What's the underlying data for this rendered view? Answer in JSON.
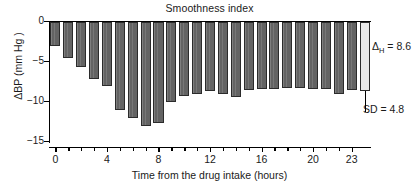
{
  "chart_data": {
    "type": "bar",
    "title": "Smoothness index",
    "xlabel": "Time from the drug intake (hours)",
    "ylabel": "ΔBP (mm Hg )",
    "ylabel_parts": {
      "delta": "Δ",
      "rest": "BP (mm Hg )"
    },
    "categories": [
      0,
      1,
      2,
      3,
      4,
      5,
      6,
      7,
      8,
      9,
      10,
      11,
      12,
      13,
      14,
      15,
      16,
      17,
      18,
      19,
      20,
      21,
      22,
      23
    ],
    "values": [
      -3.0,
      -4.5,
      -5.6,
      -7.1,
      -8.0,
      -11.0,
      -12.0,
      -13.0,
      -12.6,
      -10.0,
      -9.3,
      -9.0,
      -8.6,
      -9.0,
      -9.4,
      -8.5,
      -8.4,
      -8.4,
      -8.3,
      -8.3,
      -8.4,
      -8.4,
      -9.0,
      -8.5
    ],
    "summary_bar": {
      "label": "mean",
      "value": -8.6,
      "error_low": -11.2,
      "color": "#e8e8e8"
    },
    "ylim": [
      -15,
      0
    ],
    "yticks": [
      0,
      -5,
      -10,
      -15
    ],
    "ytick_labels": [
      "0",
      "−5",
      "−10",
      "−15"
    ],
    "xticks": [
      0,
      4,
      8,
      12,
      16,
      20,
      23
    ],
    "xtick_labels": [
      "0",
      "4",
      "8",
      "12",
      "16",
      "20",
      "23"
    ],
    "grid": false,
    "legend": "none",
    "bar_color": "#636363",
    "bar_edge_color": "#2b2b2b",
    "annotations": [
      {
        "id": "delta-h",
        "prefix": "Δ",
        "subscript": "H",
        "suffix": " = 8.6",
        "text": "ΔH = 8.6"
      },
      {
        "id": "sd",
        "text": "SD = 4.8"
      }
    ]
  }
}
